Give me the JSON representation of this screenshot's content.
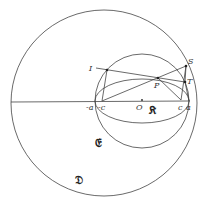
{
  "diagram": {
    "colors": {
      "stroke": "#444444",
      "background": "#ffffff"
    },
    "circles": [
      {
        "name": "D",
        "cx": 104,
        "cy": 103,
        "r": 93
      },
      {
        "name": "E",
        "cx": 142,
        "cy": 101,
        "r": 47
      }
    ],
    "ellipse": {
      "name": "K",
      "cx": 142,
      "cy": 101,
      "rx": 47,
      "ry": 22
    },
    "points": {
      "I": [
        107,
        70
      ],
      "P": [
        158,
        78
      ],
      "S": [
        186,
        66
      ],
      "T": [
        185,
        82
      ],
      "c": [
        181,
        100
      ],
      "a": [
        189,
        101
      ],
      "-c": [
        102,
        101
      ],
      "-a": [
        96,
        101
      ],
      "O": [
        142,
        100
      ]
    },
    "labels": {
      "I": "I",
      "P": "P",
      "S": "S",
      "T": "T",
      "c": "c",
      "a": "a",
      "neg_c": "-c",
      "neg_a": "-a",
      "O": "O",
      "K": "𝔎",
      "E": "𝔈",
      "D": "𝔇"
    }
  }
}
